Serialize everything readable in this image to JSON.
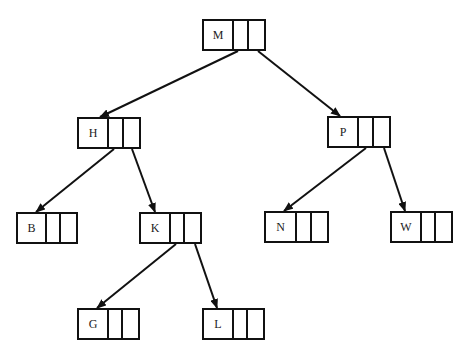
{
  "diagram": {
    "type": "binary-search-tree",
    "stroke_color": "#111111",
    "background": "#ffffff",
    "nodes": [
      {
        "id": "M",
        "label": "M",
        "x": 202,
        "y": 19,
        "w": 64
      },
      {
        "id": "H",
        "label": "H",
        "x": 77,
        "y": 117,
        "w": 64
      },
      {
        "id": "P",
        "label": "P",
        "x": 327,
        "y": 116,
        "w": 64
      },
      {
        "id": "B",
        "label": "B",
        "x": 16,
        "y": 212,
        "w": 62
      },
      {
        "id": "K",
        "label": "K",
        "x": 139,
        "y": 212,
        "w": 63
      },
      {
        "id": "N",
        "label": "N",
        "x": 264,
        "y": 211,
        "w": 65
      },
      {
        "id": "W",
        "label": "W",
        "x": 390,
        "y": 211,
        "w": 63
      },
      {
        "id": "G",
        "label": "G",
        "x": 77,
        "y": 308,
        "w": 63
      },
      {
        "id": "L",
        "label": "L",
        "x": 202,
        "y": 308,
        "w": 63
      }
    ],
    "edges": [
      {
        "from": "M",
        "to": "H",
        "x1": 238,
        "y1": 51,
        "x2": 100,
        "y2": 117
      },
      {
        "from": "M",
        "to": "P",
        "x1": 258,
        "y1": 51,
        "x2": 340,
        "y2": 116
      },
      {
        "from": "H",
        "to": "B",
        "x1": 114,
        "y1": 149,
        "x2": 36,
        "y2": 212
      },
      {
        "from": "H",
        "to": "K",
        "x1": 132,
        "y1": 149,
        "x2": 155,
        "y2": 212
      },
      {
        "from": "P",
        "to": "N",
        "x1": 366,
        "y1": 148,
        "x2": 284,
        "y2": 211
      },
      {
        "from": "P",
        "to": "W",
        "x1": 384,
        "y1": 148,
        "x2": 405,
        "y2": 211
      },
      {
        "from": "K",
        "to": "G",
        "x1": 176,
        "y1": 244,
        "x2": 97,
        "y2": 308
      },
      {
        "from": "K",
        "to": "L",
        "x1": 195,
        "y1": 244,
        "x2": 217,
        "y2": 308
      }
    ]
  }
}
